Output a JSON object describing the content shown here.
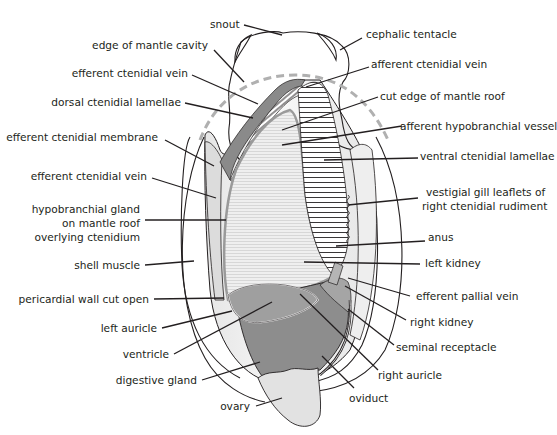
{
  "figure": {
    "colors": {
      "outline": "#231f20",
      "body_light": "#f2f2f2",
      "mantle_gray": "#b9b9b9",
      "organ_dark": "#8f8f8f",
      "organ_mid": "#a8a8a8",
      "ovary": "#e4e4e4",
      "dashed_edge": "#b0b0b0",
      "gland_stripe": "#d6d6d6"
    }
  },
  "labels": {
    "left": [
      {
        "id": "edge-of-mantle-cavity",
        "text": "edge of mantle cavity"
      },
      {
        "id": "efferent-ctenidial-vein-upper",
        "text": "efferent ctenidial vein"
      },
      {
        "id": "dorsal-ctenidial-lamellae",
        "text": "dorsal ctenidial lamellae"
      },
      {
        "id": "efferent-ctenidial-membrane",
        "text": "efferent ctenidial membrane"
      },
      {
        "id": "efferent-ctenidial-vein-lower",
        "text": "efferent ctenidial vein"
      },
      {
        "id": "hypobranchial-gland",
        "lines": [
          "hypobranchial gland",
          "on mantle roof",
          "overlying ctenidium"
        ]
      },
      {
        "id": "shell-muscle",
        "text": "shell muscle"
      },
      {
        "id": "pericardial-wall-cut-open",
        "text": "pericardial wall cut open"
      },
      {
        "id": "left-auricle",
        "text": "left auricle"
      },
      {
        "id": "ventricle",
        "text": "ventricle"
      },
      {
        "id": "digestive-gland",
        "text": "digestive gland"
      },
      {
        "id": "ovary",
        "text": "ovary"
      }
    ],
    "top": [
      {
        "id": "snout",
        "text": "snout"
      }
    ],
    "right": [
      {
        "id": "cephalic-tentacle",
        "text": "cephalic tentacle"
      },
      {
        "id": "afferent-ctenidial-vein",
        "text": "afferent ctenidial vein"
      },
      {
        "id": "cut-edge-of-mantle-roof",
        "text": "cut edge of mantle roof"
      },
      {
        "id": "afferent-hypobranchial-vessel",
        "text": "afferent hypobranchial vessel"
      },
      {
        "id": "ventral-ctenidial-lamellae",
        "text": "ventral ctenidial lamellae"
      },
      {
        "id": "vestigial-gill-leaflets",
        "lines": [
          "vestigial gill leaflets of",
          "right ctenidial rudiment"
        ]
      },
      {
        "id": "anus",
        "text": "anus"
      },
      {
        "id": "left-kidney",
        "text": "left kidney"
      },
      {
        "id": "efferent-pallial-vein",
        "text": "efferent pallial vein"
      },
      {
        "id": "right-kidney",
        "text": "right kidney"
      },
      {
        "id": "seminal-receptacle",
        "text": "seminal receptacle"
      },
      {
        "id": "right-auricle",
        "text": "right auricle"
      },
      {
        "id": "oviduct",
        "text": "oviduct"
      }
    ]
  }
}
